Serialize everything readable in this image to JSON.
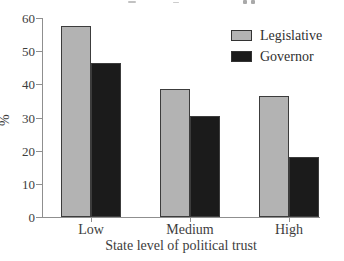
{
  "chart_data": {
    "type": "bar",
    "categories": [
      "Low",
      "Medium",
      "High"
    ],
    "series": [
      {
        "name": "Legislative",
        "color": "#b3b3b3",
        "values": [
          57.5,
          38.5,
          36.5
        ]
      },
      {
        "name": "Governor",
        "color": "#1b1b1b",
        "values": [
          46.5,
          30.5,
          18
        ]
      }
    ],
    "title": "",
    "xlabel": "State level of political trust",
    "ylabel": "%",
    "ylim": [
      0,
      60
    ],
    "yticks": [
      0,
      10,
      20,
      30,
      40,
      50,
      60
    ],
    "grid": false,
    "legend_position": "top-right",
    "colors": {
      "axis": "#8f8f8f",
      "bar_border": "#3c3c3c",
      "text": "#3d3d3d",
      "background": "#ffffff"
    }
  }
}
